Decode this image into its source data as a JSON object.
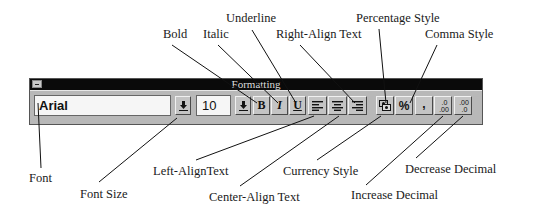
{
  "window": {
    "title": "Formatting",
    "font_name": "Arial",
    "font_size": "10"
  },
  "buttons": {
    "bold": "B",
    "italic": "I",
    "underline": "U",
    "percent": "%",
    "comma": ",",
    "increase_decimal_top": ".0",
    "increase_decimal_bottom": ".00",
    "decrease_decimal_top": ".00",
    "decrease_decimal_bottom": ".0"
  },
  "callouts": {
    "bold": "Bold",
    "italic": "Italic",
    "underline": "Underline",
    "right_align": "Right-Align  Text",
    "percentage": "Percentage  Style",
    "comma": "Comma  Style",
    "font": "Font",
    "font_size": "Font  Size",
    "left_align": "Left-AlignText",
    "center_align": "Center-Align  Text",
    "currency": "Currency  Style",
    "increase_decimal": "Increase  Decimal",
    "decrease_decimal": "Decrease  Decimal"
  },
  "icons": {
    "dropdown": "down-arrow-with-bar",
    "minimize": "system-menu-box",
    "align_left": "align-left-lines",
    "align_center": "align-center-lines",
    "align_right": "align-right-lines",
    "currency": "currency-coins"
  }
}
